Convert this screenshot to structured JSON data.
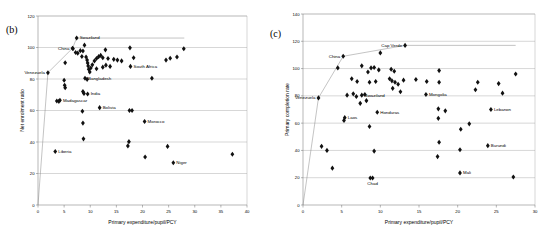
{
  "figure": {
    "background": "#ffffff",
    "marker_color": "#111111",
    "grid_color": "#9a9a9a",
    "axis_color": "#6e6e6e"
  },
  "panels": [
    {
      "id": "b",
      "label": "(b)",
      "chart_data": {
        "type": "scatter",
        "title": "",
        "xlabel": "Primary expenditure/pupil/PCY",
        "ylabel": "Net enrolment ratio",
        "xlim": [
          0,
          40
        ],
        "ylim": [
          0,
          120
        ],
        "xticks": [
          0,
          5,
          10,
          15,
          20,
          25,
          30,
          35,
          40
        ],
        "yticks": [
          0,
          20,
          40,
          60,
          80,
          100,
          120
        ],
        "grid": "horizontal",
        "legend": "none",
        "frontier": [
          [
            0,
            0
          ],
          [
            1.9,
            84
          ],
          [
            6.6,
            99.5
          ],
          [
            7.4,
            106
          ],
          [
            28,
            106
          ]
        ],
        "points": [
          {
            "x": 1.9,
            "y": 84,
            "label": "Venezuela",
            "label_pos": "left"
          },
          {
            "x": 6.6,
            "y": 99.5,
            "label": "China",
            "label_pos": "left"
          },
          {
            "x": 7.4,
            "y": 106,
            "label": "Swaziland",
            "label_pos": "right"
          },
          {
            "x": 9.0,
            "y": 80.5,
            "label": "Bangladesh",
            "label_pos": "right"
          },
          {
            "x": 9.5,
            "y": 70.5,
            "label": "India",
            "label_pos": "right"
          },
          {
            "x": 4.2,
            "y": 66.5,
            "label": "Madagascar",
            "label_pos": "right"
          },
          {
            "x": 11.8,
            "y": 61.8,
            "label": "Bolivia",
            "label_pos": "right"
          },
          {
            "x": 20.4,
            "y": 53.0,
            "label": "Morocco",
            "label_pos": "right"
          },
          {
            "x": 3.3,
            "y": 34.0,
            "label": "Liberia",
            "label_pos": "right"
          },
          {
            "x": 25.9,
            "y": 26.8,
            "label": "Niger",
            "label_pos": "right"
          },
          {
            "x": 17.7,
            "y": 88.0,
            "label": "South Africa",
            "label_pos": "right"
          },
          {
            "x": 5.2,
            "y": 90.3,
            "label": "",
            "label_pos": "none"
          },
          {
            "x": 5.0,
            "y": 79.2,
            "label": "",
            "label_pos": "none"
          },
          {
            "x": 5.1,
            "y": 76.0,
            "label": "",
            "label_pos": "none"
          },
          {
            "x": 5.2,
            "y": 74.5,
            "label": "",
            "label_pos": "none"
          },
          {
            "x": 3.6,
            "y": 66.0,
            "label": "",
            "label_pos": "none"
          },
          {
            "x": 4.0,
            "y": 65.8,
            "label": "",
            "label_pos": "none"
          },
          {
            "x": 6.7,
            "y": 99.2,
            "label": "",
            "label_pos": "none"
          },
          {
            "x": 7.2,
            "y": 96.8,
            "label": "",
            "label_pos": "none"
          },
          {
            "x": 7.6,
            "y": 96.4,
            "label": "",
            "label_pos": "none"
          },
          {
            "x": 8.1,
            "y": 98.0,
            "label": "",
            "label_pos": "none"
          },
          {
            "x": 8.4,
            "y": 94.3,
            "label": "",
            "label_pos": "none"
          },
          {
            "x": 8.6,
            "y": 97.8,
            "label": "",
            "label_pos": "none"
          },
          {
            "x": 8.9,
            "y": 101.5,
            "label": "",
            "label_pos": "none"
          },
          {
            "x": 9.2,
            "y": 94.0,
            "label": "",
            "label_pos": "none"
          },
          {
            "x": 9.4,
            "y": 92.0,
            "label": "",
            "label_pos": "none"
          },
          {
            "x": 9.5,
            "y": 90.2,
            "label": "",
            "label_pos": "none"
          },
          {
            "x": 9.6,
            "y": 88.3,
            "label": "",
            "label_pos": "none"
          },
          {
            "x": 9.7,
            "y": 86.2,
            "label": "",
            "label_pos": "none"
          },
          {
            "x": 9.9,
            "y": 84.5,
            "label": "",
            "label_pos": "none"
          },
          {
            "x": 10.1,
            "y": 87.0,
            "label": "",
            "label_pos": "none"
          },
          {
            "x": 10.4,
            "y": 89.0,
            "label": "",
            "label_pos": "none"
          },
          {
            "x": 10.8,
            "y": 91.5,
            "label": "",
            "label_pos": "none"
          },
          {
            "x": 11.2,
            "y": 93.0,
            "label": "",
            "label_pos": "none"
          },
          {
            "x": 11.6,
            "y": 94.2,
            "label": "",
            "label_pos": "none"
          },
          {
            "x": 12.0,
            "y": 95.0,
            "label": "",
            "label_pos": "none"
          },
          {
            "x": 12.4,
            "y": 93.5,
            "label": "",
            "label_pos": "none"
          },
          {
            "x": 12.9,
            "y": 98.5,
            "label": "",
            "label_pos": "none"
          },
          {
            "x": 13.4,
            "y": 93.0,
            "label": "",
            "label_pos": "none"
          },
          {
            "x": 13.8,
            "y": 88.0,
            "label": "",
            "label_pos": "none"
          },
          {
            "x": 14.5,
            "y": 92.5,
            "label": "",
            "label_pos": "none"
          },
          {
            "x": 15.2,
            "y": 92.0,
            "label": "",
            "label_pos": "none"
          },
          {
            "x": 16.0,
            "y": 91.5,
            "label": "",
            "label_pos": "none"
          },
          {
            "x": 17.6,
            "y": 99.8,
            "label": "",
            "label_pos": "none"
          },
          {
            "x": 18.3,
            "y": 93.5,
            "label": "",
            "label_pos": "none"
          },
          {
            "x": 21.8,
            "y": 80.5,
            "label": "",
            "label_pos": "none"
          },
          {
            "x": 24.5,
            "y": 92.0,
            "label": "",
            "label_pos": "none"
          },
          {
            "x": 25.3,
            "y": 93.2,
            "label": "",
            "label_pos": "none"
          },
          {
            "x": 26.6,
            "y": 94.0,
            "label": "",
            "label_pos": "none"
          },
          {
            "x": 27.9,
            "y": 99.2,
            "label": "",
            "label_pos": "none"
          },
          {
            "x": 11.2,
            "y": 86.5,
            "label": "",
            "label_pos": "none"
          },
          {
            "x": 9.4,
            "y": 79.8,
            "label": "",
            "label_pos": "none"
          },
          {
            "x": 8.6,
            "y": 72.0,
            "label": "",
            "label_pos": "none"
          },
          {
            "x": 8.8,
            "y": 70.8,
            "label": "",
            "label_pos": "none"
          },
          {
            "x": 8.5,
            "y": 59.5,
            "label": "",
            "label_pos": "none"
          },
          {
            "x": 17.5,
            "y": 60.0,
            "label": "",
            "label_pos": "none"
          },
          {
            "x": 18.0,
            "y": 60.0,
            "label": "",
            "label_pos": "none"
          },
          {
            "x": 8.6,
            "y": 52.0,
            "label": "",
            "label_pos": "none"
          },
          {
            "x": 8.7,
            "y": 42.0,
            "label": "",
            "label_pos": "none"
          },
          {
            "x": 17.4,
            "y": 40.2,
            "label": "",
            "label_pos": "none"
          },
          {
            "x": 17.2,
            "y": 37.5,
            "label": "",
            "label_pos": "none"
          },
          {
            "x": 24.8,
            "y": 37.2,
            "label": "",
            "label_pos": "none"
          },
          {
            "x": 20.5,
            "y": 30.5,
            "label": "",
            "label_pos": "none"
          },
          {
            "x": 37.2,
            "y": 32.2,
            "label": "",
            "label_pos": "none"
          },
          {
            "x": 12.4,
            "y": 87.5,
            "label": "",
            "label_pos": "none"
          },
          {
            "x": 13.0,
            "y": 88.8,
            "label": "",
            "label_pos": "none"
          }
        ]
      }
    },
    {
      "id": "c",
      "label": "(c)",
      "chart_data": {
        "type": "scatter",
        "title": "",
        "xlabel": "Primary expenditure/pupil/PCY",
        "ylabel": "Primary completion rate",
        "xlim": [
          0,
          30
        ],
        "ylim": [
          0,
          140
        ],
        "xticks": [
          0,
          5,
          10,
          15,
          20,
          25,
          30
        ],
        "yticks": [
          0,
          20,
          40,
          60,
          80,
          100,
          120,
          140
        ],
        "grid": "horizontal",
        "legend": "none",
        "frontier": [
          [
            0,
            0
          ],
          [
            2.0,
            78.5
          ],
          [
            5.2,
            109
          ],
          [
            13.2,
            117
          ],
          [
            27.5,
            117
          ]
        ],
        "points": [
          {
            "x": 2.0,
            "y": 78.5,
            "label": "Venezuela",
            "label_pos": "left"
          },
          {
            "x": 5.2,
            "y": 109.0,
            "label": "China",
            "label_pos": "left"
          },
          {
            "x": 13.2,
            "y": 117.0,
            "label": "Cap Verde",
            "label_pos": "left"
          },
          {
            "x": 7.6,
            "y": 80.5,
            "label": "Swaziland",
            "label_pos": "right"
          },
          {
            "x": 15.9,
            "y": 81.0,
            "label": "Mongolia",
            "label_pos": "right"
          },
          {
            "x": 5.4,
            "y": 64.0,
            "label": "Laos",
            "label_pos": "right"
          },
          {
            "x": 9.6,
            "y": 68.0,
            "label": "Honduras",
            "label_pos": "right"
          },
          {
            "x": 24.3,
            "y": 70.0,
            "label": "Lebanon",
            "label_pos": "right"
          },
          {
            "x": 23.9,
            "y": 43.5,
            "label": "Burundi",
            "label_pos": "right"
          },
          {
            "x": 20.3,
            "y": 23.5,
            "label": "Mali",
            "label_pos": "right"
          },
          {
            "x": 9.0,
            "y": 19.8,
            "label": "Chad",
            "label_pos": "below"
          },
          {
            "x": 4.5,
            "y": 100.5,
            "label": "",
            "label_pos": "none"
          },
          {
            "x": 10.0,
            "y": 111.5,
            "label": "",
            "label_pos": "none"
          },
          {
            "x": 7.6,
            "y": 102.0,
            "label": "",
            "label_pos": "none"
          },
          {
            "x": 8.4,
            "y": 97.5,
            "label": "",
            "label_pos": "none"
          },
          {
            "x": 8.8,
            "y": 100.5,
            "label": "",
            "label_pos": "none"
          },
          {
            "x": 9.2,
            "y": 100.8,
            "label": "",
            "label_pos": "none"
          },
          {
            "x": 9.8,
            "y": 99.0,
            "label": "",
            "label_pos": "none"
          },
          {
            "x": 11.4,
            "y": 99.5,
            "label": "",
            "label_pos": "none"
          },
          {
            "x": 11.8,
            "y": 98.0,
            "label": "",
            "label_pos": "none"
          },
          {
            "x": 17.6,
            "y": 98.5,
            "label": "",
            "label_pos": "none"
          },
          {
            "x": 27.5,
            "y": 96.0,
            "label": "",
            "label_pos": "none"
          },
          {
            "x": 6.3,
            "y": 92.5,
            "label": "",
            "label_pos": "none"
          },
          {
            "x": 7.0,
            "y": 90.5,
            "label": "",
            "label_pos": "none"
          },
          {
            "x": 8.6,
            "y": 90.0,
            "label": "",
            "label_pos": "none"
          },
          {
            "x": 9.4,
            "y": 90.5,
            "label": "",
            "label_pos": "none"
          },
          {
            "x": 11.2,
            "y": 92.5,
            "label": "",
            "label_pos": "none"
          },
          {
            "x": 11.5,
            "y": 91.0,
            "label": "",
            "label_pos": "none"
          },
          {
            "x": 11.9,
            "y": 90.0,
            "label": "",
            "label_pos": "none"
          },
          {
            "x": 12.3,
            "y": 88.5,
            "label": "",
            "label_pos": "none"
          },
          {
            "x": 13.0,
            "y": 91.5,
            "label": "",
            "label_pos": "none"
          },
          {
            "x": 14.6,
            "y": 92.0,
            "label": "",
            "label_pos": "none"
          },
          {
            "x": 16.0,
            "y": 90.5,
            "label": "",
            "label_pos": "none"
          },
          {
            "x": 17.6,
            "y": 90.0,
            "label": "",
            "label_pos": "none"
          },
          {
            "x": 22.6,
            "y": 90.0,
            "label": "",
            "label_pos": "none"
          },
          {
            "x": 25.3,
            "y": 89.0,
            "label": "",
            "label_pos": "none"
          },
          {
            "x": 22.3,
            "y": 84.5,
            "label": "",
            "label_pos": "none"
          },
          {
            "x": 25.8,
            "y": 82.0,
            "label": "",
            "label_pos": "none"
          },
          {
            "x": 6.5,
            "y": 81.5,
            "label": "",
            "label_pos": "none"
          },
          {
            "x": 6.9,
            "y": 79.5,
            "label": "",
            "label_pos": "none"
          },
          {
            "x": 5.7,
            "y": 80.5,
            "label": "",
            "label_pos": "none"
          },
          {
            "x": 8.0,
            "y": 81.0,
            "label": "",
            "label_pos": "none"
          },
          {
            "x": 12.6,
            "y": 83.0,
            "label": "",
            "label_pos": "none"
          },
          {
            "x": 11.6,
            "y": 85.5,
            "label": "",
            "label_pos": "none"
          },
          {
            "x": 7.4,
            "y": 74.5,
            "label": "",
            "label_pos": "none"
          },
          {
            "x": 8.2,
            "y": 76.5,
            "label": "",
            "label_pos": "none"
          },
          {
            "x": 17.5,
            "y": 70.5,
            "label": "",
            "label_pos": "none"
          },
          {
            "x": 18.4,
            "y": 69.0,
            "label": "",
            "label_pos": "none"
          },
          {
            "x": 5.3,
            "y": 62.0,
            "label": "",
            "label_pos": "none"
          },
          {
            "x": 8.6,
            "y": 57.5,
            "label": "",
            "label_pos": "none"
          },
          {
            "x": 17.5,
            "y": 63.5,
            "label": "",
            "label_pos": "none"
          },
          {
            "x": 20.4,
            "y": 55.5,
            "label": "",
            "label_pos": "none"
          },
          {
            "x": 21.5,
            "y": 59.5,
            "label": "",
            "label_pos": "none"
          },
          {
            "x": 2.4,
            "y": 43.0,
            "label": "",
            "label_pos": "none"
          },
          {
            "x": 3.1,
            "y": 40.0,
            "label": "",
            "label_pos": "none"
          },
          {
            "x": 3.8,
            "y": 27.0,
            "label": "",
            "label_pos": "none"
          },
          {
            "x": 9.2,
            "y": 39.5,
            "label": "",
            "label_pos": "none"
          },
          {
            "x": 17.6,
            "y": 46.0,
            "label": "",
            "label_pos": "none"
          },
          {
            "x": 17.4,
            "y": 35.5,
            "label": "",
            "label_pos": "none"
          },
          {
            "x": 20.3,
            "y": 40.5,
            "label": "",
            "label_pos": "none"
          },
          {
            "x": 8.7,
            "y": 19.8,
            "label": "",
            "label_pos": "none"
          },
          {
            "x": 27.2,
            "y": 20.5,
            "label": "",
            "label_pos": "none"
          }
        ]
      }
    }
  ]
}
